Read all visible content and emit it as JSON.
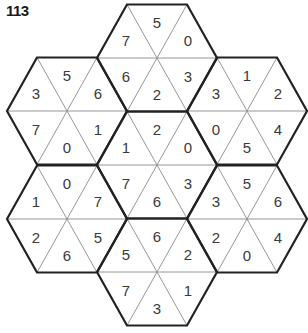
{
  "puzzle": {
    "title": "113",
    "line_colors": {
      "thick": "#222222",
      "thin": "#8a8a8a"
    },
    "cell_order": [
      "top",
      "upper-left",
      "upper-right",
      "lower-left",
      "lower-right",
      "bottom"
    ],
    "hexagons": [
      {
        "id": "top",
        "center": [
          157,
          58
        ],
        "values": [
          5,
          7,
          0,
          6,
          3,
          2
        ]
      },
      {
        "id": "left-upper",
        "center": [
          67,
          111
        ],
        "values": [
          5,
          3,
          6,
          7,
          1,
          0
        ]
      },
      {
        "id": "right-upper",
        "center": [
          247,
          111
        ],
        "values": [
          1,
          3,
          2,
          0,
          4,
          5
        ]
      },
      {
        "id": "center",
        "center": [
          157,
          165
        ],
        "values": [
          2,
          1,
          0,
          7,
          3,
          6
        ]
      },
      {
        "id": "left-lower",
        "center": [
          67,
          219
        ],
        "values": [
          0,
          1,
          7,
          2,
          5,
          6
        ]
      },
      {
        "id": "right-lower",
        "center": [
          247,
          219
        ],
        "values": [
          5,
          3,
          6,
          2,
          4,
          0
        ]
      },
      {
        "id": "bottom",
        "center": [
          157,
          272
        ],
        "values": [
          6,
          5,
          2,
          7,
          1,
          3
        ]
      }
    ]
  }
}
